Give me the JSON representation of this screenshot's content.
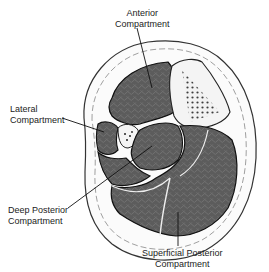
{
  "diagram": {
    "labels": {
      "anterior": {
        "line1": "Anterior",
        "line2": "Compartment"
      },
      "lateral": {
        "line1": "Lateral",
        "line2": "Compartment"
      },
      "deep_posterior": {
        "line1": "Deep Posterior",
        "line2": "Compartment"
      },
      "superficial_posterior": {
        "line1": "Superficial Posterior",
        "line2": "Compartment"
      }
    },
    "structures": [
      "tibia",
      "fibula",
      "skin",
      "subcutaneous-fat"
    ],
    "colors": {
      "muscle": "#5a5a5a",
      "muscle_pattern": "#7a7a7a",
      "bone": "#f2f2f2",
      "skin_fill": "#fafafa",
      "outline": "#1a1a1a"
    }
  }
}
